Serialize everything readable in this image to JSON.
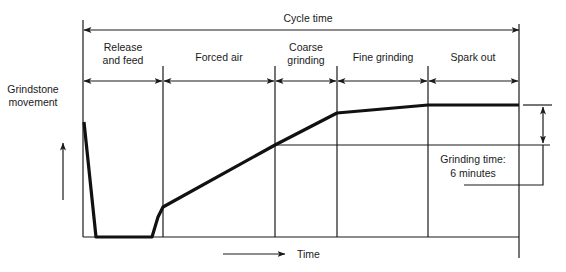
{
  "diagram": {
    "title": "Cycle time",
    "y_axis_label_line1": "Grindstone",
    "y_axis_label_line2": "movement",
    "x_axis_label": "Time",
    "phases": [
      {
        "line1": "Release",
        "line2": "and feed"
      },
      {
        "line1": "Forced air",
        "line2": ""
      },
      {
        "line1": "Coarse",
        "line2": "grinding"
      },
      {
        "line1": "Fine grinding",
        "line2": ""
      },
      {
        "line1": "Spark out",
        "line2": ""
      }
    ],
    "annotation_line1": "Grinding time:",
    "annotation_line2": "6 minutes"
  },
  "colors": {
    "line": "#111111",
    "background": "#ffffff"
  }
}
